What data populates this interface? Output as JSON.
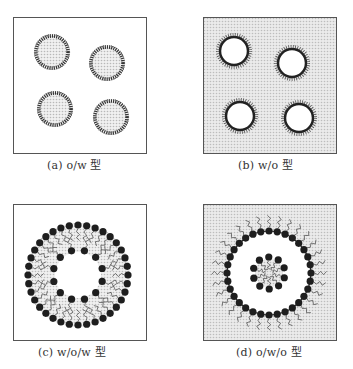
{
  "figure": {
    "panels": [
      {
        "id": "a",
        "caption": "(a) o/w 型",
        "type": "o/w",
        "description": "oil droplets dispersed in water",
        "background": "water",
        "droplets": 4
      },
      {
        "id": "b",
        "caption": "(b) w/o 型",
        "type": "w/o",
        "description": "water droplets dispersed in oil",
        "background": "oil",
        "droplets": 4
      },
      {
        "id": "c",
        "caption": "(c) w/o/w 型",
        "type": "w/o/w",
        "description": "water-in-oil-in-water double emulsion",
        "background": "water"
      },
      {
        "id": "d",
        "caption": "(d) o/w/o 型",
        "type": "o/w/o",
        "description": "oil-in-water-in-oil double emulsion",
        "background": "oil"
      }
    ],
    "colors": {
      "border": "#555555",
      "oil_fill": "#e2e2e2",
      "water_fill": "#ffffff",
      "surfactant_head": "#1e1e1e",
      "surfactant_tail": "#444444"
    }
  }
}
